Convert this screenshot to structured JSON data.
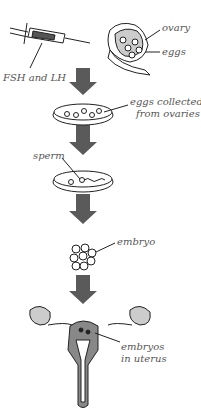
{
  "diagram": {
    "type": "process-flow",
    "steps": [
      {
        "id": "hormones",
        "label": "FSH and LH"
      },
      {
        "id": "ovary",
        "labels": [
          "ovary",
          "eggs"
        ]
      },
      {
        "id": "collection",
        "label_line1": "eggs collected",
        "label_line2": "from ovaries"
      },
      {
        "id": "fertilisation",
        "label": "sperm"
      },
      {
        "id": "embryo",
        "label": "embryo"
      },
      {
        "id": "implantation",
        "label_line1": "embryos",
        "label_line2": "in uterus"
      }
    ],
    "colors": {
      "arrow": "#5a5a5a",
      "outline": "#222222",
      "fill": "#d0d0d0",
      "label": "#555555"
    }
  }
}
